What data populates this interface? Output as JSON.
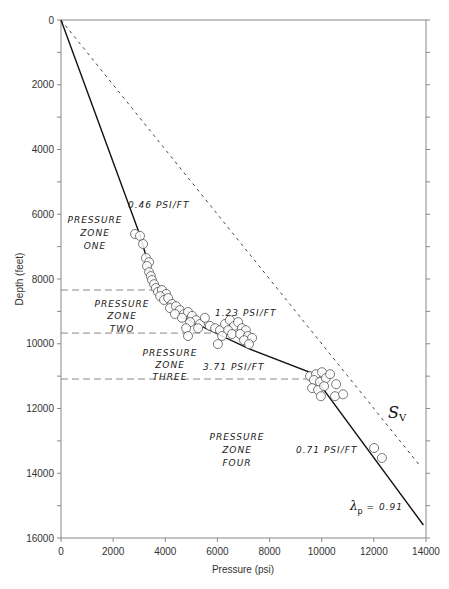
{
  "chart_data": {
    "type": "scatter",
    "title": "",
    "xlabel": "Pressure (psi)",
    "ylabel": "Depth (feet)",
    "xlim": [
      0,
      14000
    ],
    "ylim": [
      16000,
      0
    ],
    "y_inverted": true,
    "grid": false,
    "legend": null,
    "x_ticks": [
      0,
      2000,
      4000,
      6000,
      8000,
      10000,
      12000,
      14000
    ],
    "x_tick_labels": [
      "0",
      "2000",
      "4000",
      "6000",
      "8000",
      "10000",
      "12000",
      "14000"
    ],
    "y_ticks": [
      0,
      2000,
      4000,
      6000,
      8000,
      10000,
      12000,
      14000,
      16000
    ],
    "y_tick_labels": [
      "0",
      "2000",
      "4000",
      "6000",
      "8000",
      "10000",
      "12000",
      "14000",
      "16000"
    ],
    "y_minor_ticks": [
      1000,
      3000,
      5000,
      7000,
      9000,
      11000,
      13000,
      15000
    ],
    "series": [
      {
        "name": "Pressure gradient (solid line)",
        "kind": "line",
        "style": "solid",
        "points": [
          [
            0,
            0
          ],
          [
            3030,
            6650
          ],
          [
            3550,
            8100
          ],
          [
            4700,
            9200
          ],
          [
            7200,
            10150
          ],
          [
            9600,
            10900
          ],
          [
            13900,
            15600
          ]
        ]
      },
      {
        "name": "Sv (overburden, dashed)",
        "kind": "line",
        "style": "dashed",
        "points": [
          [
            0,
            0
          ],
          [
            13800,
            13800
          ]
        ]
      },
      {
        "name": "Measured pressures",
        "kind": "scatter",
        "marker": "open-circle",
        "points": [
          [
            2840,
            6610
          ],
          [
            3030,
            6670
          ],
          [
            3150,
            6920
          ],
          [
            3260,
            7350
          ],
          [
            3380,
            7480
          ],
          [
            3300,
            7600
          ],
          [
            3380,
            7790
          ],
          [
            3450,
            7910
          ],
          [
            3490,
            8030
          ],
          [
            3570,
            8160
          ],
          [
            3640,
            8280
          ],
          [
            3720,
            8400
          ],
          [
            3870,
            8340
          ],
          [
            4030,
            8460
          ],
          [
            3800,
            8530
          ],
          [
            3950,
            8650
          ],
          [
            4110,
            8590
          ],
          [
            4260,
            8770
          ],
          [
            4180,
            8900
          ],
          [
            4410,
            8840
          ],
          [
            4560,
            8960
          ],
          [
            4370,
            9080
          ],
          [
            4720,
            9080
          ],
          [
            4870,
            9020
          ],
          [
            5030,
            9140
          ],
          [
            4640,
            9200
          ],
          [
            5180,
            9270
          ],
          [
            4950,
            9330
          ],
          [
            5330,
            9390
          ],
          [
            5520,
            9200
          ],
          [
            4800,
            9520
          ],
          [
            5260,
            9520
          ],
          [
            5710,
            9450
          ],
          [
            5910,
            9520
          ],
          [
            6100,
            9580
          ],
          [
            6290,
            9390
          ],
          [
            6480,
            9270
          ],
          [
            6640,
            9450
          ],
          [
            6410,
            9580
          ],
          [
            6790,
            9330
          ],
          [
            6940,
            9520
          ],
          [
            7090,
            9580
          ],
          [
            6180,
            9760
          ],
          [
            6560,
            9700
          ],
          [
            6870,
            9700
          ],
          [
            7170,
            9760
          ],
          [
            7020,
            9890
          ],
          [
            7330,
            9820
          ],
          [
            4870,
            9760
          ],
          [
            7210,
            10010
          ],
          [
            6020,
            10010
          ],
          [
            9550,
            11000
          ],
          [
            9780,
            10940
          ],
          [
            10010,
            10880
          ],
          [
            9700,
            11120
          ],
          [
            9930,
            11180
          ],
          [
            10160,
            11060
          ],
          [
            10320,
            10940
          ],
          [
            9630,
            11370
          ],
          [
            9860,
            11430
          ],
          [
            10090,
            11310
          ],
          [
            9970,
            11620
          ],
          [
            10550,
            11250
          ],
          [
            10510,
            11620
          ],
          [
            10820,
            11560
          ],
          [
            12010,
            13220
          ],
          [
            12310,
            13530
          ]
        ]
      }
    ],
    "zone_boundaries": [
      {
        "depth": 8340,
        "x_end": 3700
      },
      {
        "depth": 9670,
        "x_end": 5900
      },
      {
        "depth": 11090,
        "x_end": 9500
      }
    ],
    "annotations": [
      {
        "text": "0.46 PSI/FT",
        "x": 2600,
        "y": 5700
      },
      {
        "text": "PRESSURE",
        "x": 1300,
        "y": 6250
      },
      {
        "text": "ZONE",
        "x": 1300,
        "y": 6650
      },
      {
        "text": "ONE",
        "x": 1300,
        "y": 7050
      },
      {
        "text": "PRESSURE",
        "x": 1950,
        "y": 8820
      },
      {
        "text": "ZONE",
        "x": 1950,
        "y": 9200
      },
      {
        "text": "TWO",
        "x": 1950,
        "y": 9580
      },
      {
        "text": "1.23 PSI/FT",
        "x": 6050,
        "y": 9100
      },
      {
        "text": "PRESSURE",
        "x": 4200,
        "y": 10250
      },
      {
        "text": "ZONE",
        "x": 4200,
        "y": 10650
      },
      {
        "text": "THREE",
        "x": 4200,
        "y": 11040
      },
      {
        "text": "3.71 PSI/FT",
        "x": 6550,
        "y": 10700
      },
      {
        "text": "PRESSURE",
        "x": 6800,
        "y": 12970
      },
      {
        "text": "ZONE",
        "x": 6800,
        "y": 13370
      },
      {
        "text": "FOUR",
        "x": 6800,
        "y": 13760
      },
      {
        "text": "0.71 PSI/FT",
        "x": 10200,
        "y": 13850
      },
      {
        "text": "Sv",
        "x": 12600,
        "y": 12250
      },
      {
        "text": "λp = 0.91",
        "x": 11500,
        "y": 15050
      }
    ]
  },
  "labels": {
    "x_axis_title": "Pressure (psi)",
    "y_axis_title": "Depth (feet)",
    "slope_zone1": "0.46 PSI/FT",
    "slope_zone2": "1.23 PSI/FT",
    "slope_zone3": "3.71 PSI/FT",
    "slope_zone4": "0.71 PSI/FT",
    "zone_word": "PRESSURE",
    "zone_sub": "ZONE",
    "zone1": "ONE",
    "zone2": "TWO",
    "zone3": "THREE",
    "zone4": "FOUR",
    "sv_main": "S",
    "sv_sub": "V",
    "lambda_symbol": "λ",
    "lambda_sub": "p",
    "lambda_value": " = 0.91"
  },
  "colors": {
    "axis": "#888888",
    "solid_line": "#111111",
    "dashed_line": "#444444",
    "zone_dash": "#888888",
    "marker_stroke": "#555555",
    "text": "#222222"
  }
}
